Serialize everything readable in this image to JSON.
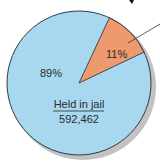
{
  "chart_data": {
    "type": "pie",
    "title": "",
    "slices": [
      {
        "label": "Held in jail",
        "value": 592462,
        "percent": 89,
        "color": "#A8D8F0"
      },
      {
        "label": "",
        "value": null,
        "percent": 11,
        "color": "#EC9A6E"
      }
    ],
    "labels": {
      "major_percent": "89%",
      "minor_percent": "11%",
      "major_name": "Held in jail",
      "major_count": "592,462"
    },
    "style": {
      "outline": "#2f3b45",
      "shadow": "#b9b9b9",
      "leader_line": "#333333"
    },
    "legend": "none",
    "grid": false
  }
}
